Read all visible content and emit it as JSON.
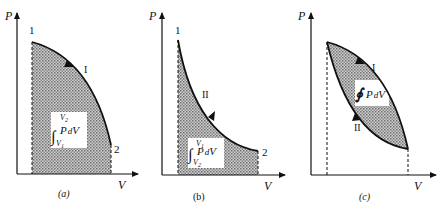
{
  "figure": {
    "colors": {
      "ink": "#111111",
      "shade": "#9a9a9a",
      "background": "#ffffff"
    },
    "panels": [
      {
        "id": "a",
        "caption": "(a)",
        "y_axis": "P",
        "x_axis": "V",
        "start_point": "1",
        "end_point": "2",
        "path_label": "I",
        "integral": {
          "symbol": "∫",
          "upper": "V2",
          "lower": "V1",
          "integrand": "P dV"
        }
      },
      {
        "id": "b",
        "caption": "(b)",
        "y_axis": "P",
        "x_axis": "V",
        "start_point": "1",
        "end_point": "2",
        "path_label": "II",
        "integral": {
          "symbol": "∫",
          "upper": "V1",
          "lower": "V2",
          "integrand": "P dV"
        }
      },
      {
        "id": "c",
        "caption": "(c)",
        "y_axis": "P",
        "x_axis": "V",
        "path_label_upper": "I",
        "path_label_lower": "II",
        "integral": {
          "symbol": "∮",
          "integrand": "P dV"
        }
      }
    ]
  }
}
